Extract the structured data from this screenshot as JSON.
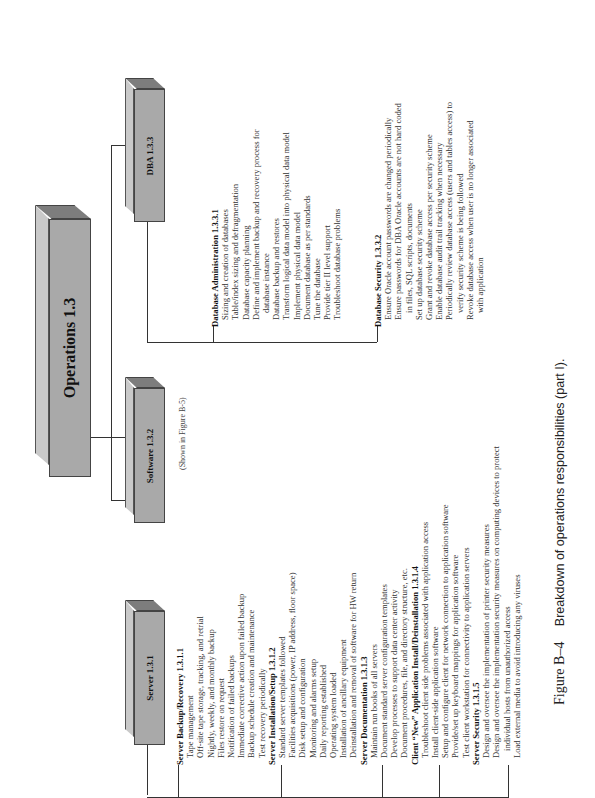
{
  "root": {
    "label": "Operations 1.3"
  },
  "branches": [
    {
      "label": "Server 1.3.1"
    },
    {
      "label": "Software 1.3.2",
      "note": "(Shown in Figure B-5)"
    },
    {
      "label": "DBA 1.3.3"
    }
  ],
  "server_sections": [
    {
      "title": "Server Backup/Recovery 1.3.1.1",
      "items": [
        "Tape management",
        "Off-site tape storage, tracking, and retrial",
        "Nightly, weekly, and monthly backup",
        "Files restore on request",
        "Notification of failed backups",
        "Immediate corrective action upon failed backup",
        "Backup schedule creation and maintenance",
        "Test recovery periodically"
      ]
    },
    {
      "title": "Server Installation/Setup 1.3.1.2",
      "items": [
        "Standard server templates followed",
        "Facilities acquisitions (power, IP address, floor space)",
        "Disk setup and configuration",
        "Monitoring and alarms setup",
        "Daily reporting established",
        "Operating system loaded",
        "Installation of ancillary equipment",
        "Deinstallation and removal of software for HW return"
      ]
    },
    {
      "title": "Server Documentation 1.3.1.3",
      "items": [
        "Maintain run books of all servers",
        "Document standard server configuration templates",
        "Develop processes to support data center activity",
        "Document procedures, file, and directory structure, etc."
      ]
    },
    {
      "title": "Client “New” Application Install/Deinstallation 1.3.1.4",
      "items": [
        "Troubleshoot client side problems associated with application access",
        "Install client-side application software",
        "Setup and configure client for network connection to application software",
        "Provide/set up keyboard mappings for application software",
        "Test client workstation for connectivity to application servers"
      ]
    },
    {
      "title": "Server Security 1.3.1.5",
      "items": [
        "Design and oversee the implementation of printer security measures",
        "Design and oversee the implementation security measures on computing devices to protect",
        "~individual hosts from unauthorized access",
        "Load external media to avoid introducing any viruses"
      ]
    }
  ],
  "dba_sections": [
    {
      "title": "Database Administration 1.3.3.1",
      "items": [
        "Sizing and creation of databases",
        "Table/index sizing and defragmentation",
        "Database capacity planning",
        "Define and implement backup and recovery process for",
        "~database instance",
        "Database backup and restores",
        "Transform logical data model into physical data model",
        "Implement physical data model",
        "Document database as per standards",
        "Tune the database",
        "Provide tier II level support",
        "Troubleshoot database problems"
      ]
    },
    {
      "title": "Database Security 1.3.3.2",
      "items": [
        "Ensure Oracle account passwords  are changed  periodically",
        "Ensure passwords for DBA Oracle accounts are not hard coded",
        "~in files, SQL scripts, documents",
        "Set up database security scheme",
        "Grant and revoke database access per security scheme",
        "Enable database audit trail tracking when necessary",
        "Periodically review database access (users and tables access) to",
        "~verify security scheme is being followed",
        "Revoke database access when user is no longer associated",
        "~with application"
      ]
    }
  ],
  "caption": {
    "figure": "Figure B–4",
    "text": "Breakdown of operations responsibilities (part I)."
  }
}
